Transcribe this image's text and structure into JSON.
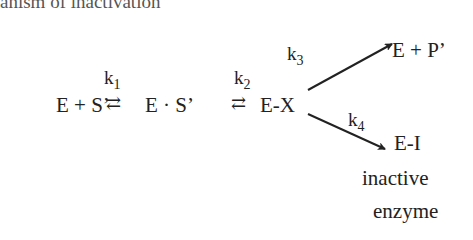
{
  "header_fragment": "anism of inactivation",
  "scheme": {
    "reactant": "E + S’",
    "complex": "E · S’",
    "intermediate": "E-X",
    "product": "E + P’",
    "inactive": "E-I",
    "inactive_label_line1": "inactive",
    "inactive_label_line2": "enzyme",
    "equilibrium_symbol": "⇄",
    "rate_constants": {
      "k1": {
        "k": "k",
        "sub": "1"
      },
      "k2": {
        "k": "k",
        "sub": "2"
      },
      "k3": {
        "k": "k",
        "sub": "3"
      },
      "k4": {
        "k": "k",
        "sub": "4"
      }
    }
  }
}
